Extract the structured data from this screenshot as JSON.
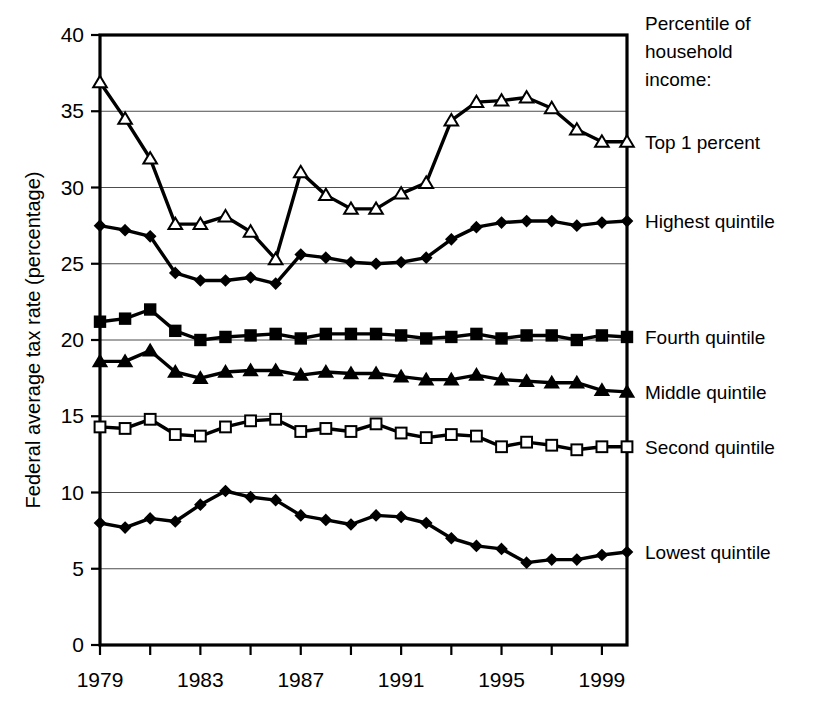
{
  "chart_data": {
    "type": "line",
    "title": "",
    "xlabel": "",
    "ylabel": "Federal average tax rate (percentage)",
    "xlim": [
      1979,
      2000
    ],
    "ylim": [
      0,
      40
    ],
    "yticks": [
      0,
      5,
      10,
      15,
      20,
      25,
      30,
      35,
      40
    ],
    "ytick_labels": [
      "0",
      "5",
      "10",
      "15",
      "20",
      "25",
      "30",
      "35",
      "40"
    ],
    "gridlines": [
      5,
      10,
      15,
      20,
      25,
      30,
      35
    ],
    "grid": true,
    "xticks": [
      1979,
      1981,
      1983,
      1985,
      1987,
      1989,
      1991,
      1993,
      1995,
      1997,
      1999
    ],
    "xtick_labels": [
      "1979",
      "",
      "1983",
      "",
      "1987",
      "",
      "1991",
      "",
      "1995",
      "",
      "1999"
    ],
    "xtick_labels_shown": [
      "1979",
      "1983",
      "1987",
      "1991",
      "1995",
      "1999"
    ],
    "x": [
      1979,
      1980,
      1981,
      1982,
      1983,
      1984,
      1985,
      1986,
      1987,
      1988,
      1989,
      1990,
      1991,
      1992,
      1993,
      1994,
      1995,
      1996,
      1997,
      1998,
      1999,
      2000
    ],
    "legend_position": "right",
    "legend_title": "Percentile of household income:",
    "series": [
      {
        "name": "Top 1 percent",
        "marker": "open-triangle",
        "values": [
          36.9,
          34.5,
          31.9,
          27.6,
          27.6,
          28.1,
          27.1,
          25.3,
          31.0,
          29.5,
          28.6,
          28.6,
          29.6,
          30.3,
          34.4,
          35.6,
          35.7,
          35.9,
          35.2,
          33.8,
          33.0,
          33.0
        ]
      },
      {
        "name": "Highest quintile",
        "marker": "filled-diamond",
        "values": [
          27.5,
          27.2,
          26.8,
          24.4,
          23.9,
          23.9,
          24.1,
          23.7,
          25.6,
          25.4,
          25.1,
          25.0,
          25.1,
          25.4,
          26.6,
          27.4,
          27.7,
          27.8,
          27.8,
          27.5,
          27.7,
          27.8
        ]
      },
      {
        "name": "Fourth quintile",
        "marker": "filled-square",
        "values": [
          21.2,
          21.4,
          22.0,
          20.6,
          20.0,
          20.2,
          20.3,
          20.4,
          20.1,
          20.4,
          20.4,
          20.4,
          20.3,
          20.1,
          20.2,
          20.4,
          20.1,
          20.3,
          20.3,
          20.0,
          20.3,
          20.2
        ]
      },
      {
        "name": "Middle quintile",
        "marker": "filled-triangle",
        "values": [
          18.6,
          18.6,
          19.3,
          17.9,
          17.5,
          17.9,
          18.0,
          18.0,
          17.7,
          17.9,
          17.8,
          17.8,
          17.6,
          17.4,
          17.4,
          17.7,
          17.4,
          17.3,
          17.2,
          17.2,
          16.7,
          16.6
        ]
      },
      {
        "name": "Second quintile",
        "marker": "open-square",
        "values": [
          14.3,
          14.2,
          14.8,
          13.8,
          13.7,
          14.3,
          14.7,
          14.8,
          14.0,
          14.2,
          14.0,
          14.5,
          13.9,
          13.6,
          13.8,
          13.7,
          13.0,
          13.3,
          13.1,
          12.8,
          13.0,
          13.0
        ]
      },
      {
        "name": "Lowest quintile",
        "marker": "filled-diamond",
        "values": [
          8.0,
          7.7,
          8.3,
          8.1,
          9.2,
          10.1,
          9.7,
          9.5,
          8.5,
          8.2,
          7.9,
          8.5,
          8.4,
          8.0,
          7.0,
          6.5,
          6.3,
          5.4,
          5.6,
          5.6,
          5.9,
          6.1
        ]
      }
    ]
  },
  "legend": {
    "header_lines": [
      "Percentile  of",
      "household",
      "income:"
    ],
    "entries": [
      {
        "label": "Top 1 percent",
        "marker": "open-triangle"
      },
      {
        "label": "Highest quintile",
        "marker": "filled-diamond"
      },
      {
        "label": "Fourth quintile",
        "marker": "filled-square"
      },
      {
        "label": "Middle quintile",
        "marker": "filled-triangle"
      },
      {
        "label": "Second quintile",
        "marker": "open-square"
      },
      {
        "label": "Lowest quintile",
        "marker": "filled-diamond"
      }
    ]
  },
  "colors": {
    "line": "#000000",
    "grid": "#4d4d4d",
    "frame": "#000000",
    "background": "#ffffff"
  }
}
